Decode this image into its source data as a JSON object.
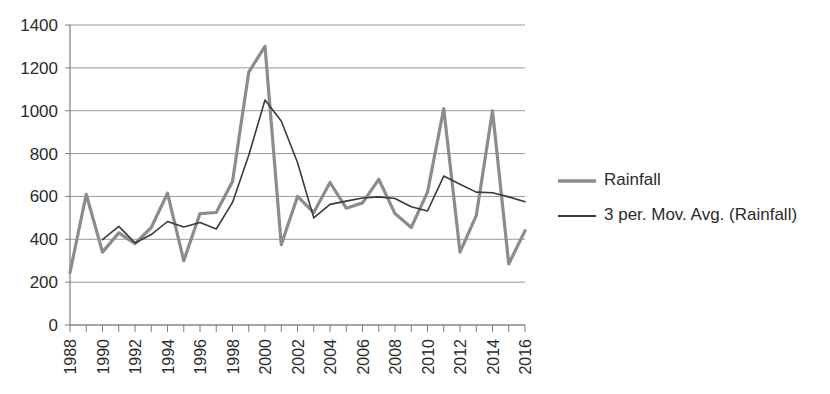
{
  "chart_data": {
    "type": "line",
    "title": "",
    "subtitle": "",
    "xlabel": "",
    "ylabel": "",
    "xlim": [
      1988,
      2016
    ],
    "ylim": [
      0,
      1400
    ],
    "ytick_step": 200,
    "xtick_step_labeled": 2,
    "xtick_step_minor": 1,
    "grid": true,
    "legend_position": "right",
    "x": [
      1988,
      1989,
      1990,
      1991,
      1992,
      1993,
      1994,
      1995,
      1996,
      1997,
      1998,
      1999,
      2000,
      2001,
      2002,
      2003,
      2004,
      2005,
      2006,
      2007,
      2008,
      2009,
      2010,
      2011,
      2012,
      2013,
      2014,
      2015,
      2016
    ],
    "xticklabels": [
      "1988",
      "1990",
      "1992",
      "1994",
      "1996",
      "1998",
      "2000",
      "2002",
      "2004",
      "2006",
      "2008",
      "2010",
      "2012",
      "2014",
      "2016"
    ],
    "yticklabels": [
      "0",
      "200",
      "400",
      "600",
      "800",
      "1000",
      "1200",
      "1400"
    ],
    "series": [
      {
        "name": "Rainfall",
        "color": "#8c8c8c",
        "width": 3.2,
        "values": [
          245,
          610,
          340,
          430,
          380,
          455,
          615,
          300,
          520,
          525,
          670,
          1180,
          1300,
          375,
          600,
          525,
          665,
          545,
          570,
          680,
          520,
          455,
          620,
          1010,
          340,
          510,
          1000,
          285,
          440
        ]
      },
      {
        "name": "3 per. Mov. Avg. (Rainfall)",
        "color": "#3a3a3a",
        "width": 1.6,
        "values": [
          null,
          null,
          398,
          460,
          383,
          422,
          483,
          457,
          478,
          448,
          572,
          792,
          1050,
          952,
          758,
          500,
          563,
          578,
          593,
          598,
          590,
          552,
          532,
          695,
          657,
          620,
          617,
          598,
          575
        ]
      }
    ],
    "legend": [
      {
        "label": "Rainfall",
        "color": "#8c8c8c",
        "width": 3.4
      },
      {
        "label": "3 per. Mov. Avg. (Rainfall)",
        "color": "#3a3a3a",
        "width": 1.8
      }
    ]
  }
}
